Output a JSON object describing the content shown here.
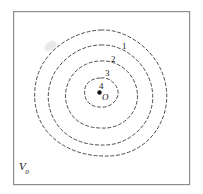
{
  "figure": {
    "background_color": "#ffffff",
    "frame": {
      "stroke_color": "#8d8d8d",
      "stroke_width": 1.2,
      "x": 13,
      "y": 11,
      "width": 177,
      "height": 174
    },
    "field_label": {
      "base": "V",
      "subscript": "0",
      "x": 19,
      "y": 163
    },
    "origin": {
      "label": "O",
      "dot_x": 100,
      "dot_y": 93,
      "dot_radius": 2.2,
      "dot_color": "#111111",
      "label_x": 102,
      "label_y": 94
    },
    "contour_style": {
      "stroke_color": "#4a4a4a",
      "stroke_width": 1.0,
      "dash_pattern": "3,2.6",
      "fill": "none"
    },
    "contours": [
      {
        "label": "1",
        "level": 1,
        "rx": 67,
        "ry": 63,
        "cx": 101,
        "cy": 93,
        "rotation": -8,
        "label_x": 122,
        "label_y": 42
      },
      {
        "label": "2",
        "level": 2,
        "rx": 52,
        "ry": 48,
        "cx": 101,
        "cy": 92,
        "rotation": -8,
        "label_x": 111,
        "label_y": 55
      },
      {
        "label": "3",
        "level": 3,
        "rx": 35,
        "ry": 32,
        "cx": 101,
        "cy": 92,
        "rotation": -8,
        "label_x": 105,
        "label_y": 69
      },
      {
        "label": "4",
        "level": 4,
        "rx": 15,
        "ry": 14,
        "cx": 101,
        "cy": 92,
        "rotation": -8,
        "label_x": 99,
        "label_y": 82
      }
    ],
    "artifact": {
      "name": "scan-smudge",
      "x": 44,
      "y": 42
    }
  },
  "chart_data": {
    "type": "contour",
    "xlabel": "",
    "ylabel": "",
    "grid": false,
    "legend": null,
    "annotations": [
      "O",
      "V0"
    ],
    "levels": [
      1,
      2,
      3,
      4
    ],
    "level_labels": [
      "1",
      "2",
      "3",
      "4"
    ],
    "series": [
      {
        "name": "contour-1",
        "level": 1,
        "radius_x": 67,
        "radius_y": 63
      },
      {
        "name": "contour-2",
        "level": 2,
        "radius_x": 52,
        "radius_y": 48
      },
      {
        "name": "contour-3",
        "level": 3,
        "radius_x": 35,
        "radius_y": 32
      },
      {
        "name": "contour-4",
        "level": 4,
        "radius_x": 15,
        "radius_y": 14
      }
    ],
    "center": {
      "name": "O",
      "x": 100,
      "y": 93
    }
  }
}
